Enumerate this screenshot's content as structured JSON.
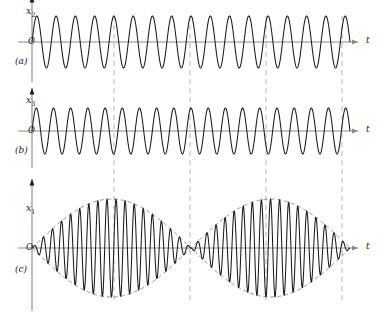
{
  "figure": {
    "kind": "beats-superposition-waveform-figure",
    "width": 382,
    "height": 312,
    "background": "#ffffff",
    "curve_color": "#1a1a1a",
    "axis_color": "#8a8a8a",
    "guide_color": "#c2c2c2",
    "envelope_color": "#6e6e6e"
  },
  "panels": [
    {
      "id": "a",
      "panel_label": "(a)",
      "y_axis_label": "x",
      "y_axis_sub": "2",
      "x_axis_label": "t",
      "origin_label": "O",
      "baseline_y": 42,
      "amplitude": 26,
      "cycles": 16.5,
      "phase_deg": 0
    },
    {
      "id": "b",
      "panel_label": "(b)",
      "y_axis_label": "x",
      "y_axis_sub": "3",
      "x_axis_label": "t",
      "origin_label": "O",
      "baseline_y": 131,
      "amplitude": 23,
      "cycles": 18.5,
      "phase_deg": 0
    },
    {
      "id": "c",
      "panel_label": "(c)",
      "y_axis_label": "x",
      "y_axis_sub": "1",
      "x_axis_label": "t",
      "origin_label": "O",
      "baseline_y": 248,
      "amplitude": 49,
      "cycles": 35,
      "beat_lobes": 2,
      "has_envelope": true,
      "envelope_style": "dashed"
    }
  ],
  "guide_lines": {
    "style": "dashed",
    "x_positions": [
      114,
      190,
      266,
      342
    ],
    "top": 16,
    "bottom": 300
  },
  "chart_data": {
    "type": "line",
    "title": "",
    "xlabel": "t",
    "ylabel": "x",
    "grid": false,
    "legend": "none",
    "x_range": [
      0,
      1
    ],
    "series": [
      {
        "name": "x2",
        "panel": "a",
        "form": "A*sin(w2*t)",
        "relative_amplitude": 1.0,
        "relative_frequency": 16.5,
        "ylim": [
          -1,
          1
        ]
      },
      {
        "name": "x3",
        "panel": "b",
        "form": "A*sin(w3*t)",
        "relative_amplitude": 1.0,
        "relative_frequency": 18.5,
        "ylim": [
          -1,
          1
        ]
      },
      {
        "name": "x1 = x2 + x3",
        "panel": "c",
        "form": "2A*cos((w3-w2)t/2)*sin((w3+w2)t/2)",
        "relative_amplitude": 2.0,
        "relative_frequency": 17.5,
        "beat_frequency": 2.0,
        "ylim": [
          -2,
          2
        ]
      }
    ]
  }
}
